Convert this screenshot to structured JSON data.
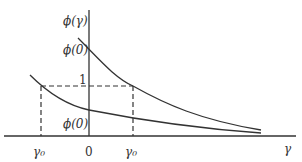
{
  "diagram": {
    "labels": {
      "y_axis": "ϕ(γ)",
      "upper_intercept": "ϕ(0)",
      "one": "1",
      "lower_intercept": "ϕ(0)",
      "gamma0_left": "γ₀",
      "origin": "0",
      "gamma0_right": "γ₀",
      "x_axis": "γ"
    },
    "colors": {
      "stroke": "#333333",
      "background": "#ffffff"
    },
    "curves": [
      {
        "name": "upper-curve",
        "description": "decreasing convex curve through ϕ(0) above 1, crossing level 1 at +γ₀"
      },
      {
        "name": "lower-curve",
        "description": "decreasing convex curve through ϕ(0) below 1, crossing level 1 at −γ₀"
      }
    ],
    "guides": [
      {
        "name": "level-one",
        "style": "dashed",
        "from": "-γ₀",
        "to": "+γ₀",
        "y": "1"
      },
      {
        "name": "left-drop",
        "style": "dashed",
        "x": "-γ₀"
      },
      {
        "name": "right-drop",
        "style": "dashed",
        "x": "+γ₀"
      }
    ]
  }
}
